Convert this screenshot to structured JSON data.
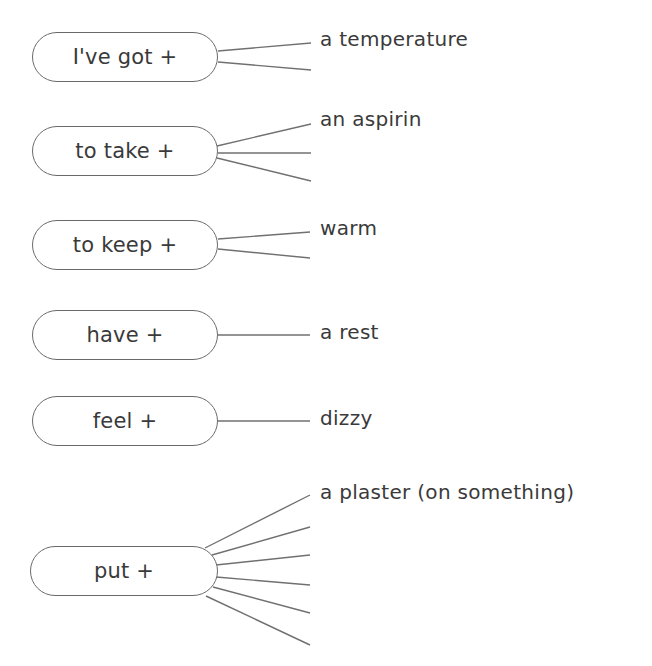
{
  "diagram": {
    "type": "word-collocation-map",
    "line_color": "#707070",
    "text_color": "#3a3a3a",
    "nodes": [
      {
        "label": "I've got +",
        "box": {
          "x": 32,
          "y": 32,
          "w": 186,
          "h": 50
        },
        "branches": [
          {
            "x1": 218,
            "y1": 51,
            "x2": 311,
            "y2": 43,
            "text": "a temperature"
          },
          {
            "x1": 218,
            "y1": 62,
            "x2": 311,
            "y2": 70,
            "text": ""
          }
        ]
      },
      {
        "label": "to take +",
        "box": {
          "x": 32,
          "y": 126,
          "w": 186,
          "h": 50
        },
        "branches": [
          {
            "x1": 217,
            "y1": 146,
            "x2": 311,
            "y2": 124,
            "text": "an aspirin"
          },
          {
            "x1": 218,
            "y1": 153,
            "x2": 311,
            "y2": 153,
            "text": ""
          },
          {
            "x1": 217,
            "y1": 158,
            "x2": 311,
            "y2": 181,
            "text": ""
          }
        ]
      },
      {
        "label": "to keep +",
        "box": {
          "x": 32,
          "y": 220,
          "w": 186,
          "h": 50
        },
        "branches": [
          {
            "x1": 218,
            "y1": 239,
            "x2": 310,
            "y2": 232,
            "text": "warm"
          },
          {
            "x1": 218,
            "y1": 249,
            "x2": 310,
            "y2": 258,
            "text": ""
          }
        ]
      },
      {
        "label": "have +",
        "box": {
          "x": 32,
          "y": 310,
          "w": 186,
          "h": 50
        },
        "branches": [
          {
            "x1": 218,
            "y1": 335,
            "x2": 310,
            "y2": 335,
            "text": "a rest"
          }
        ]
      },
      {
        "label": "feel +",
        "box": {
          "x": 32,
          "y": 396,
          "w": 186,
          "h": 50
        },
        "branches": [
          {
            "x1": 218,
            "y1": 421,
            "x2": 310,
            "y2": 421,
            "text": "dizzy"
          }
        ]
      },
      {
        "label": "put +",
        "box": {
          "x": 30,
          "y": 546,
          "w": 188,
          "h": 50
        },
        "branches": [
          {
            "x1": 205,
            "y1": 548,
            "x2": 310,
            "y2": 495,
            "text": "a plaster (on something)"
          },
          {
            "x1": 212,
            "y1": 555,
            "x2": 310,
            "y2": 527,
            "text": ""
          },
          {
            "x1": 216,
            "y1": 565,
            "x2": 310,
            "y2": 555,
            "text": ""
          },
          {
            "x1": 216,
            "y1": 577,
            "x2": 310,
            "y2": 585,
            "text": ""
          },
          {
            "x1": 213,
            "y1": 587,
            "x2": 310,
            "y2": 613,
            "text": ""
          },
          {
            "x1": 206,
            "y1": 596,
            "x2": 310,
            "y2": 645,
            "text": ""
          }
        ]
      }
    ]
  }
}
